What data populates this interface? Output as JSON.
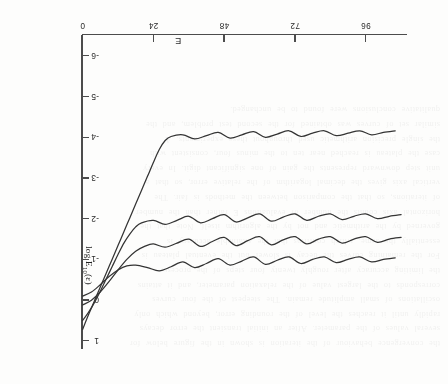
{
  "page": {
    "orientation": "upside-down-scan",
    "background_color": "#fdfdfc",
    "ink_color": "#343434",
    "axis_color": "#4c4c4c"
  },
  "ghost_text": {
    "description": "faint show-through text from reverse of scanned page",
    "lines": [
      "the convergence behaviour of the iteration is shown in the figure below for",
      "several values of the parameter. After an initial transient the error decays",
      "rapidly until it reaches the level of the rounding error, beyond which only",
      "oscillations of small amplitude remain. The steepest of the four curves",
      "corresponds to the largest value of the relaxation parameter, and it attains",
      "the limiting accuracy after roughly twenty four steps of the process.",
      "For the remaining curves the decay is slower but the eventual plateau is",
      "essentially the same, which confirms that the attainable accuracy is",
      "governed by the arithmetic and not by the algorithm itself. Note that the",
      "horizontal axis counts the number of evaluations E rather than the number",
      "of iterations, so that the comparison between the methods is fair. The",
      "vertical axis gives the decimal logarithm of the relative error, so that a",
      "unit step downward represents the gain of one significant digit. In every",
      "case the plateau is reached near ten to the minus four, consistent with",
      "the single precision arithmetic used throughout these experiments. A",
      "similar set of curves was obtained for the second test problem, and the",
      "qualitative conclusions were found to be unchanged."
    ]
  },
  "chart_data": {
    "type": "line",
    "title": "",
    "xlabel": "E",
    "ylabel": "log E10(e)",
    "ylabel_display": "log E",
    "ylabel_sub": "10",
    "ylabel_arg": "(ε)",
    "xlim": [
      0,
      110
    ],
    "ylim": [
      -6.5,
      1.2
    ],
    "xticks": [
      0,
      24,
      48,
      72,
      96
    ],
    "xtick_labels": [
      "0",
      "24",
      "48",
      "72",
      "96"
    ],
    "yticks": [
      -6,
      -5,
      -4,
      -3,
      -2,
      -1,
      0,
      1
    ],
    "ytick_labels": [
      "-6",
      "-5",
      "-4",
      "-3",
      "-2",
      "-1",
      "0",
      "1"
    ],
    "grid": false,
    "legend": false,
    "series": [
      {
        "name": "curve-1",
        "note": "steepest decay, reaches plateau near E=24",
        "x": [
          0,
          2,
          4,
          6,
          8,
          10,
          12,
          14,
          16,
          18,
          20,
          22,
          24,
          26,
          28,
          30,
          34,
          38,
          42,
          46,
          50,
          54,
          58,
          62,
          66,
          70,
          74,
          78,
          82,
          86,
          90,
          94,
          98,
          102,
          106
        ],
        "y": [
          0.72,
          0.36,
          0.02,
          -0.32,
          -0.66,
          -1.0,
          -1.34,
          -1.68,
          -2.02,
          -2.36,
          -2.7,
          -3.04,
          -3.38,
          -3.7,
          -3.92,
          -4.02,
          -4.06,
          -3.96,
          -4.04,
          -4.12,
          -3.98,
          -4.06,
          -4.14,
          -4.0,
          -4.08,
          -4.16,
          -4.02,
          -4.1,
          -4.16,
          -4.04,
          -4.1,
          -4.16,
          -4.06,
          -4.12,
          -4.16
        ]
      },
      {
        "name": "curve-2",
        "note": "intermediate decay",
        "x": [
          0,
          2,
          4,
          6,
          8,
          10,
          12,
          14,
          16,
          18,
          20,
          24,
          28,
          32,
          36,
          40,
          44,
          48,
          52,
          56,
          60,
          64,
          68,
          72,
          76,
          80,
          84,
          88,
          92,
          96,
          100,
          104,
          108
        ],
        "y": [
          0.5,
          0.3,
          0.06,
          -0.22,
          -0.52,
          -0.82,
          -1.12,
          -1.4,
          -1.62,
          -1.8,
          -1.9,
          -1.96,
          -1.86,
          -1.96,
          -2.06,
          -1.9,
          -2.0,
          -2.1,
          -1.92,
          -2.02,
          -2.12,
          -1.94,
          -2.04,
          -2.12,
          -1.96,
          -2.06,
          -2.12,
          -1.98,
          -2.06,
          -2.12,
          -2.0,
          -2.06,
          -2.1
        ]
      },
      {
        "name": "curve-3",
        "note": "slower decay",
        "x": [
          0,
          3,
          6,
          9,
          12,
          15,
          18,
          21,
          24,
          28,
          32,
          36,
          40,
          44,
          48,
          52,
          56,
          60,
          64,
          68,
          72,
          76,
          80,
          84,
          88,
          92,
          96,
          100,
          104,
          108
        ],
        "y": [
          0.12,
          0.0,
          -0.2,
          -0.46,
          -0.74,
          -1.0,
          -1.2,
          -1.32,
          -1.38,
          -1.3,
          -1.4,
          -1.5,
          -1.32,
          -1.44,
          -1.54,
          -1.34,
          -1.46,
          -1.56,
          -1.36,
          -1.48,
          -1.56,
          -1.38,
          -1.5,
          -1.56,
          -1.4,
          -1.5,
          -1.56,
          -1.42,
          -1.5,
          -1.54
        ]
      },
      {
        "name": "curve-4",
        "note": "slowest decay, shallow minimum near E=14",
        "x": [
          0,
          3,
          6,
          9,
          12,
          15,
          18,
          22,
          26,
          30,
          34,
          38,
          42,
          46,
          50,
          54,
          58,
          62,
          66,
          70,
          74,
          78,
          82,
          86,
          90,
          94,
          98,
          102,
          106
        ],
        "y": [
          -0.1,
          -0.2,
          -0.38,
          -0.58,
          -0.74,
          -0.84,
          -0.86,
          -0.8,
          -0.72,
          -0.82,
          -0.94,
          -0.8,
          -0.9,
          -1.02,
          -0.86,
          -0.96,
          -1.06,
          -0.88,
          -0.98,
          -1.06,
          -0.9,
          -1.0,
          -1.06,
          -0.92,
          -1.0,
          -1.06,
          -0.94,
          -1.0,
          -1.04
        ]
      }
    ]
  }
}
